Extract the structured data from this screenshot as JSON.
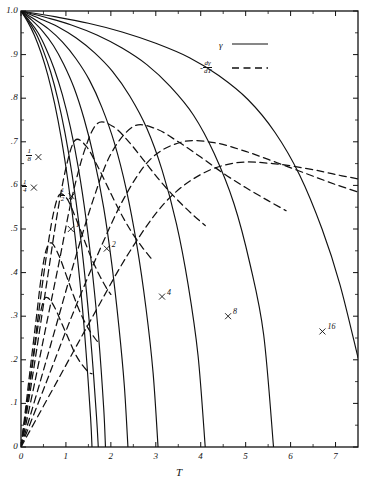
{
  "chart_data": {
    "type": "line",
    "title": "",
    "xlabel": "T",
    "ylabel": "",
    "xlim": [
      0,
      7.5
    ],
    "ylim": [
      0,
      1.0
    ],
    "grid": false,
    "legend_position": "top-right",
    "x_ticks": [
      0,
      1,
      2,
      3,
      4,
      5,
      6,
      7
    ],
    "x_ticklabels": [
      "0",
      "1",
      "2",
      "3",
      "4",
      "5",
      "6",
      "7"
    ],
    "y_ticks": [
      0,
      0.1,
      0.2,
      0.3,
      0.4,
      0.5,
      0.6,
      0.7,
      0.8,
      0.9,
      1.0
    ],
    "y_ticklabels": [
      "0",
      ".1",
      ".2",
      ".3",
      ".4",
      ".5",
      ".6",
      ".7",
      ".8",
      ".9",
      "1.0"
    ],
    "legend": [
      {
        "name": "gamma",
        "label": "γ",
        "style": "solid"
      },
      {
        "name": "neg-d-gamma-dT",
        "label_numerator": "dγ",
        "label_denominator": "dT",
        "label_sign": "-",
        "style": "dashed"
      }
    ],
    "parameters": [
      "1/8",
      "1/4",
      "1/2",
      "1",
      "2",
      "4",
      "8",
      "16"
    ],
    "series": [
      {
        "name": "gamma-1over8",
        "param": "1/8",
        "style": "solid",
        "x_end": 1.58,
        "x": [
          0,
          0.15,
          0.3,
          0.45,
          0.6,
          0.75,
          0.9,
          1.05,
          1.2,
          1.35,
          1.45,
          1.55,
          1.58
        ],
        "y": [
          1.0,
          0.975,
          0.944,
          0.903,
          0.852,
          0.787,
          0.706,
          0.606,
          0.486,
          0.338,
          0.215,
          0.065,
          0.0
        ]
      },
      {
        "name": "gamma-1over4",
        "param": "1/4",
        "style": "solid",
        "x_end": 1.72,
        "x": [
          0,
          0.17,
          0.34,
          0.5,
          0.66,
          0.82,
          0.98,
          1.14,
          1.3,
          1.46,
          1.58,
          1.68,
          1.72
        ],
        "y": [
          1.0,
          0.976,
          0.947,
          0.908,
          0.86,
          0.798,
          0.72,
          0.623,
          0.503,
          0.353,
          0.212,
          0.07,
          0.0
        ]
      },
      {
        "name": "gamma-1over2",
        "param": "1/2",
        "style": "solid",
        "x_end": 1.88,
        "x": [
          0,
          0.19,
          0.38,
          0.56,
          0.74,
          0.92,
          1.1,
          1.28,
          1.45,
          1.6,
          1.73,
          1.84,
          1.88
        ],
        "y": [
          1.0,
          0.977,
          0.95,
          0.913,
          0.867,
          0.808,
          0.733,
          0.638,
          0.521,
          0.39,
          0.25,
          0.09,
          0.0
        ]
      },
      {
        "name": "gamma-1",
        "param": "1",
        "style": "solid",
        "x_end": 2.38,
        "x": [
          0,
          0.24,
          0.48,
          0.72,
          0.95,
          1.18,
          1.4,
          1.62,
          1.84,
          2.02,
          2.18,
          2.3,
          2.38
        ],
        "y": [
          1.0,
          0.979,
          0.954,
          0.921,
          0.878,
          0.824,
          0.754,
          0.665,
          0.549,
          0.42,
          0.275,
          0.14,
          0.0
        ]
      },
      {
        "name": "gamma-2",
        "param": "2",
        "style": "solid",
        "x_end": 3.05,
        "x": [
          0,
          0.3,
          0.61,
          0.92,
          1.22,
          1.52,
          1.8,
          2.08,
          2.34,
          2.58,
          2.78,
          2.94,
          3.05
        ],
        "y": [
          1.0,
          0.981,
          0.959,
          0.929,
          0.891,
          0.842,
          0.779,
          0.697,
          0.592,
          0.462,
          0.32,
          0.17,
          0.0
        ]
      },
      {
        "name": "gamma-4",
        "param": "4",
        "style": "solid",
        "x_end": 4.1,
        "x": [
          0,
          0.41,
          0.82,
          1.23,
          1.64,
          2.04,
          2.42,
          2.8,
          3.14,
          3.46,
          3.72,
          3.94,
          4.1
        ],
        "y": [
          1.0,
          0.983,
          0.964,
          0.938,
          0.904,
          0.861,
          0.805,
          0.731,
          0.635,
          0.512,
          0.372,
          0.21,
          0.0
        ]
      },
      {
        "name": "gamma-8",
        "param": "8",
        "style": "solid",
        "x_end": 5.62,
        "x": [
          0,
          0.56,
          1.12,
          1.69,
          2.25,
          2.8,
          3.32,
          3.84,
          4.3,
          4.74,
          5.1,
          5.4,
          5.62
        ],
        "y": [
          1.0,
          0.985,
          0.968,
          0.945,
          0.915,
          0.877,
          0.827,
          0.761,
          0.673,
          0.558,
          0.418,
          0.258,
          0.0
        ]
      },
      {
        "name": "gamma-16",
        "param": "16",
        "style": "solid",
        "x_end": 7.5,
        "x": [
          0,
          0.75,
          1.5,
          2.25,
          3.0,
          3.75,
          4.4,
          5.05,
          5.65,
          6.2,
          6.7,
          7.1,
          7.5
        ],
        "y": [
          1.0,
          0.987,
          0.972,
          0.952,
          0.926,
          0.893,
          0.852,
          0.797,
          0.722,
          0.624,
          0.5,
          0.372,
          0.205
        ]
      },
      {
        "name": "dgamma-1over8",
        "param": "1/8",
        "style": "dashed",
        "peak_x": 0.55,
        "peak_y": 0.345,
        "x": [
          0,
          0.1,
          0.2,
          0.3,
          0.4,
          0.5,
          0.6,
          0.75,
          0.9,
          1.05,
          1.2,
          1.35,
          1.5,
          1.58
        ],
        "y": [
          0.0,
          0.072,
          0.145,
          0.222,
          0.29,
          0.335,
          0.342,
          0.32,
          0.285,
          0.25,
          0.215,
          0.19,
          0.172,
          0.168
        ]
      },
      {
        "name": "dgamma-1over4",
        "param": "1/4",
        "style": "dashed",
        "peak_x": 0.62,
        "peak_y": 0.47,
        "x": [
          0,
          0.11,
          0.22,
          0.34,
          0.45,
          0.56,
          0.68,
          0.84,
          1.0,
          1.16,
          1.32,
          1.48,
          1.64,
          1.72
        ],
        "y": [
          0.0,
          0.095,
          0.192,
          0.295,
          0.39,
          0.452,
          0.468,
          0.44,
          0.396,
          0.35,
          0.308,
          0.275,
          0.25,
          0.24
        ]
      },
      {
        "name": "dgamma-1over2",
        "param": "1/2",
        "style": "dashed",
        "peak_x": 0.85,
        "peak_y": 0.58,
        "x": [
          0,
          0.14,
          0.28,
          0.42,
          0.57,
          0.71,
          0.85,
          1.02,
          1.2,
          1.38,
          1.56,
          1.74,
          1.9,
          2.0
        ],
        "y": [
          0.0,
          0.105,
          0.215,
          0.33,
          0.442,
          0.53,
          0.578,
          0.57,
          0.53,
          0.482,
          0.435,
          0.395,
          0.365,
          0.35
        ]
      },
      {
        "name": "dgamma-1",
        "param": "1",
        "style": "dashed",
        "peak_x": 1.2,
        "peak_y": 0.705,
        "x": [
          0,
          0.2,
          0.4,
          0.6,
          0.8,
          1.0,
          1.2,
          1.45,
          1.7,
          1.95,
          2.2,
          2.45,
          2.7,
          2.9
        ],
        "y": [
          0.0,
          0.125,
          0.258,
          0.395,
          0.53,
          0.64,
          0.703,
          0.69,
          0.645,
          0.592,
          0.54,
          0.495,
          0.458,
          0.432
        ]
      },
      {
        "name": "dgamma-2",
        "param": "2",
        "style": "dashed",
        "peak_x": 1.7,
        "peak_y": 0.745,
        "x": [
          0,
          0.28,
          0.56,
          0.85,
          1.13,
          1.42,
          1.7,
          2.05,
          2.4,
          2.75,
          3.1,
          3.45,
          3.8,
          4.1
        ],
        "y": [
          0.0,
          0.135,
          0.278,
          0.425,
          0.57,
          0.682,
          0.742,
          0.735,
          0.7,
          0.655,
          0.61,
          0.57,
          0.535,
          0.508
        ]
      },
      {
        "name": "dgamma-4",
        "param": "4",
        "style": "dashed",
        "peak_x": 2.5,
        "peak_y": 0.735,
        "x": [
          0,
          0.4,
          0.8,
          1.2,
          1.6,
          2.0,
          2.5,
          3.0,
          3.5,
          4.0,
          4.5,
          5.0,
          5.5,
          5.9
        ],
        "y": [
          0.0,
          0.14,
          0.285,
          0.43,
          0.565,
          0.672,
          0.735,
          0.73,
          0.7,
          0.665,
          0.628,
          0.595,
          0.565,
          0.542
        ]
      },
      {
        "name": "dgamma-8",
        "param": "8",
        "style": "dashed",
        "peak_x": 3.6,
        "peak_y": 0.7,
        "x": [
          0,
          0.55,
          1.1,
          1.7,
          2.3,
          2.9,
          3.6,
          4.3,
          5.0,
          5.7,
          6.4,
          7.0,
          7.5
        ],
        "y": [
          0.0,
          0.145,
          0.292,
          0.44,
          0.572,
          0.662,
          0.7,
          0.698,
          0.678,
          0.652,
          0.625,
          0.602,
          0.585
        ]
      },
      {
        "name": "dgamma-16",
        "param": "16",
        "style": "dashed",
        "peak_x": 5.2,
        "peak_y": 0.655,
        "x": [
          0,
          0.8,
          1.6,
          2.4,
          3.2,
          4.0,
          4.8,
          5.6,
          6.4,
          7.0,
          7.5
        ],
        "y": [
          0.0,
          0.15,
          0.3,
          0.445,
          0.56,
          0.625,
          0.652,
          0.65,
          0.638,
          0.625,
          0.615
        ]
      }
    ],
    "annotations": [
      {
        "name": "label-1over8",
        "text_numerator": "1",
        "text_denominator": "8",
        "kind": "fraction",
        "x": 0.12,
        "y": 0.665
      },
      {
        "name": "label-1over4",
        "text_numerator": "1",
        "text_denominator": "4",
        "kind": "fraction",
        "x": 0.02,
        "y": 0.595
      },
      {
        "name": "label-1over2",
        "text_numerator": "1",
        "text_denominator": "2",
        "kind": "fraction",
        "x": 0.86,
        "y": 0.575
      },
      {
        "name": "label-1",
        "text": "1",
        "kind": "plain",
        "x": 1.22,
        "y": 0.5
      },
      {
        "name": "label-2",
        "text": "2",
        "kind": "plain",
        "x": 2.02,
        "y": 0.455
      },
      {
        "name": "label-4",
        "text": "4",
        "kind": "plain",
        "x": 3.25,
        "y": 0.345
      },
      {
        "name": "label-8",
        "text": "8",
        "kind": "plain",
        "x": 4.72,
        "y": 0.3
      },
      {
        "name": "label-16",
        "text": "16",
        "kind": "plain",
        "x": 6.82,
        "y": 0.265
      }
    ],
    "colors": {
      "ink": "#111111",
      "background": "#ffffff"
    }
  }
}
